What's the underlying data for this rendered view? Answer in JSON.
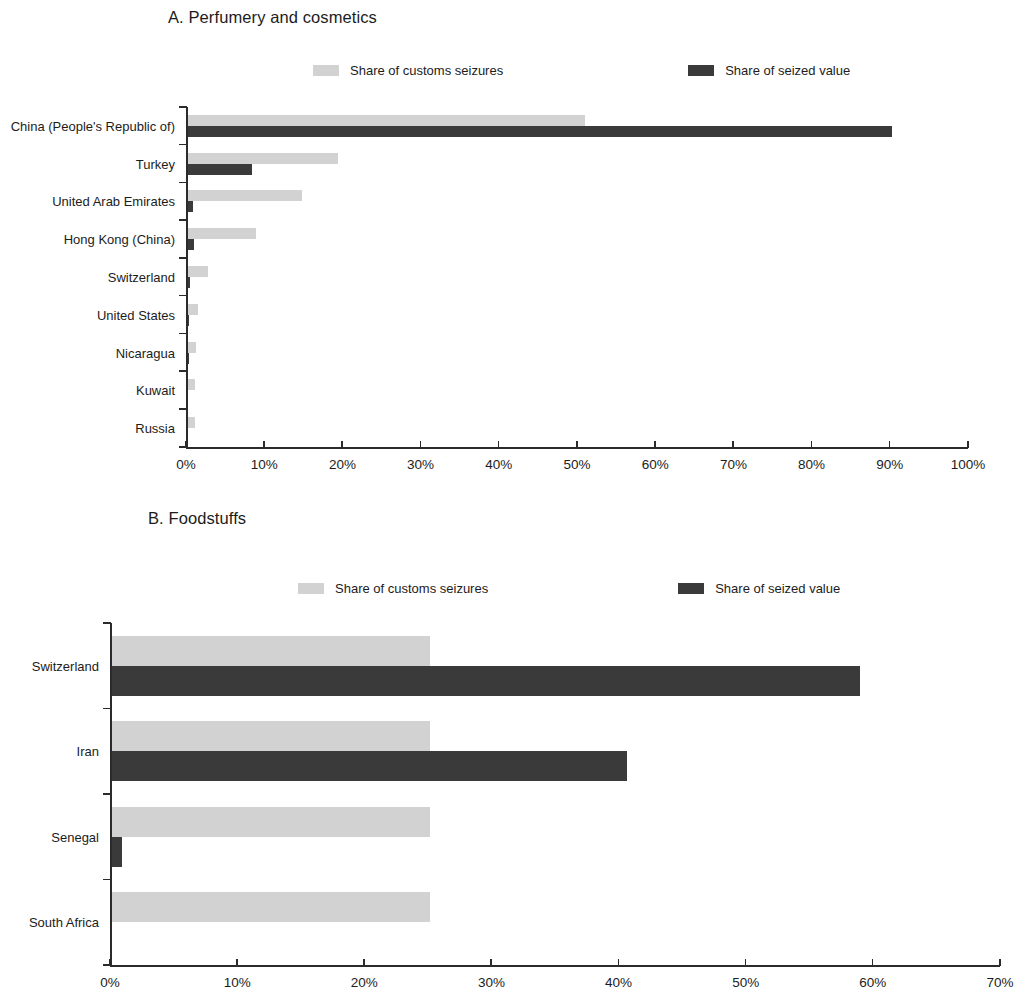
{
  "colors": {
    "light_gray": "#d2d2d2",
    "dark_gray": "#3a3a3a",
    "axis": "#2b2b2b",
    "text": "#1c1c1c",
    "background": "#ffffff"
  },
  "legend": {
    "series_light_label": "Share of customs seizures",
    "series_dark_label": "Share of seized value"
  },
  "panel_a": {
    "title": "A. Perfumery and cosmetics"
  },
  "panel_b": {
    "title": "B. Foodstuffs"
  },
  "chart_data": [
    {
      "id": "panel-a",
      "type": "bar",
      "orientation": "horizontal",
      "title": "A. Perfumery and cosmetics",
      "xlabel": "",
      "ylabel": "",
      "xlim": [
        0,
        100
      ],
      "xticks": [
        0,
        10,
        20,
        30,
        40,
        50,
        60,
        70,
        80,
        90,
        100
      ],
      "xtick_labels": [
        "0%",
        "10%",
        "20%",
        "30%",
        "40%",
        "50%",
        "60%",
        "70%",
        "80%",
        "90%",
        "100%"
      ],
      "grid": false,
      "legend_position": "top",
      "categories": [
        "China (People's Republic of)",
        "Turkey",
        "United Arab Emirates",
        "Hong Kong (China)",
        "Switzerland",
        "United States",
        "Nicaragua",
        "Kuwait",
        "Russia"
      ],
      "series": [
        {
          "name": "Share of customs seizures",
          "color": "#d2d2d2",
          "values": [
            50.8,
            19.2,
            14.6,
            8.7,
            2.6,
            1.3,
            1.0,
            0.9,
            0.9
          ]
        },
        {
          "name": "Share of seized value",
          "color": "#3a3a3a",
          "values": [
            90.0,
            8.2,
            0.7,
            0.8,
            0.2,
            0.1,
            0.1,
            0.0,
            0.0
          ]
        }
      ]
    },
    {
      "id": "panel-b",
      "type": "bar",
      "orientation": "horizontal",
      "title": "B. Foodstuffs",
      "xlabel": "",
      "ylabel": "",
      "xlim": [
        0,
        70
      ],
      "xticks": [
        0,
        10,
        20,
        30,
        40,
        50,
        60,
        70
      ],
      "xtick_labels": [
        "0%",
        "10%",
        "20%",
        "30%",
        "40%",
        "50%",
        "60%",
        "70%"
      ],
      "grid": false,
      "legend_position": "top",
      "categories": [
        "Switzerland",
        "Iran",
        "Senegal",
        "South Africa"
      ],
      "series": [
        {
          "name": "Share of customs seizures",
          "color": "#d2d2d2",
          "values": [
            25.0,
            25.0,
            25.0,
            25.0
          ]
        },
        {
          "name": "Share of seized value",
          "color": "#3a3a3a",
          "values": [
            58.8,
            40.5,
            0.8,
            0.0
          ]
        }
      ]
    }
  ]
}
